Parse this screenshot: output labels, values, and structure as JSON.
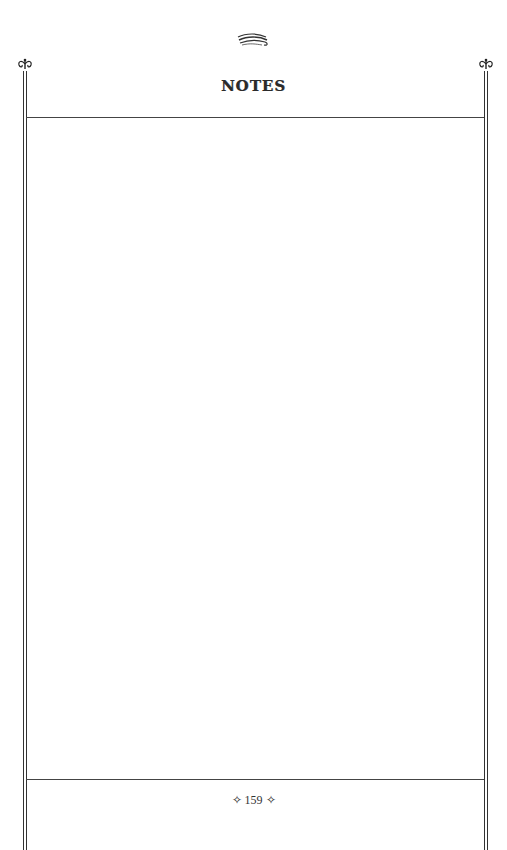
{
  "page": {
    "title": "NOTES",
    "page_number": "159",
    "page_number_display": "✧ 159 ✧",
    "ornaments": {
      "top_center": "swash-flourish-icon",
      "top_left": "fleur-finial-icon",
      "top_right": "fleur-finial-icon"
    },
    "colors": {
      "rule": "#333333",
      "text": "#222222",
      "background": "#ffffff"
    }
  }
}
